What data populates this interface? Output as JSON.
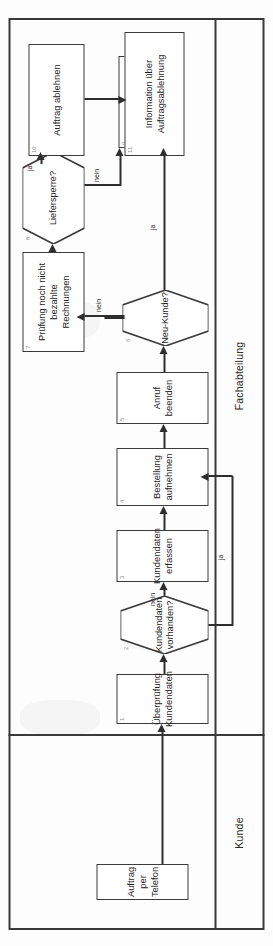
{
  "document": {
    "type": "flowchart",
    "language": "de",
    "orientation": "rotated-90",
    "title": "Auftragsannahme Prozess"
  },
  "colors": {
    "stroke": "#3b3b3b",
    "edge": "#2e2e2e",
    "frame": "#3a3a3a",
    "background": "#ffffff",
    "number": "#8d8d8d"
  },
  "lanes": [
    {
      "id": "lane-kunde",
      "label": "Kunde"
    },
    {
      "id": "lane-fachabteilung",
      "label": "Fachabteilung"
    }
  ],
  "nodes": [
    {
      "id": "n-auftrag-telefon",
      "num": "",
      "shape": "task",
      "lane": "lane-kunde",
      "label": "Auftrag\nper Telefon",
      "line1": "Auftrag",
      "line2": "per Telefon"
    },
    {
      "id": "n-1",
      "num": "1",
      "shape": "task",
      "lane": "lane-fachabteilung",
      "label": "Überprüfung\nKundendaten",
      "line1": "Überprüfung",
      "line2": "Kundendaten"
    },
    {
      "id": "n-2",
      "num": "2",
      "shape": "gateway",
      "lane": "lane-fachabteilung",
      "label": "Kundendaten\nvorhanden?",
      "line1": "Kundendaten",
      "line2": "vorhanden?"
    },
    {
      "id": "n-3",
      "num": "3",
      "shape": "task",
      "lane": "lane-fachabteilung",
      "label": "Kundendaten\nerfassen",
      "line1": "Kundendaten",
      "line2": "erfassen"
    },
    {
      "id": "n-4",
      "num": "4",
      "shape": "task",
      "lane": "lane-fachabteilung",
      "label": "Bestellung\naufnehmen",
      "line1": "Bestellung",
      "line2": "aufnehmen"
    },
    {
      "id": "n-5",
      "num": "5",
      "shape": "task",
      "lane": "lane-fachabteilung",
      "label": "Anruf beenden",
      "line1": "Anruf beenden",
      "line2": ""
    },
    {
      "id": "n-6",
      "num": "6",
      "shape": "gateway",
      "lane": "lane-fachabteilung",
      "label": "Neu-Kunde?",
      "line1": "Neu-Kunde?",
      "line2": ""
    },
    {
      "id": "n-7",
      "num": "7",
      "shape": "task",
      "lane": "lane-fachabteilung",
      "label": "Prüfung noch nicht\nbezahlte\nRechnungen",
      "line1": "Prüfung  noch nicht",
      "line2": "bezahlte",
      "line3": "Rechnungen"
    },
    {
      "id": "n-8",
      "num": "8",
      "shape": "gateway",
      "lane": "lane-fachabteilung",
      "label": "Liefersperre?",
      "line1": "Liefersperre?",
      "line2": ""
    },
    {
      "id": "n-9",
      "num": "9",
      "shape": "task",
      "lane": "lane-fachabteilung",
      "label": "Auftrag\nannehmen",
      "line1": "Auftrag",
      "line2": "annehmen"
    },
    {
      "id": "n-10",
      "num": "10",
      "shape": "task",
      "lane": "lane-fachabteilung",
      "label": "Auftrag ablehnen",
      "line1": "Auftrag ablehnen",
      "line2": ""
    },
    {
      "id": "n-11",
      "num": "11",
      "shape": "task",
      "lane": "lane-kunde",
      "label": "Information über\nAuftragsablehnung",
      "line1": "Information über",
      "line2": "Auftragsablehnung"
    }
  ],
  "edges": [
    {
      "id": "e-telefon-1",
      "from": "n-auftrag-telefon",
      "to": "n-1",
      "label": ""
    },
    {
      "id": "e-1-2",
      "from": "n-1",
      "to": "n-2",
      "label": ""
    },
    {
      "id": "e-2-3",
      "from": "n-2",
      "to": "n-3",
      "label": "nein"
    },
    {
      "id": "e-2-4",
      "from": "n-2",
      "to": "n-4",
      "label": "ja"
    },
    {
      "id": "e-3-4",
      "from": "n-3",
      "to": "n-4",
      "label": ""
    },
    {
      "id": "e-4-5",
      "from": "n-4",
      "to": "n-5",
      "label": ""
    },
    {
      "id": "e-5-6",
      "from": "n-5",
      "to": "n-6",
      "label": ""
    },
    {
      "id": "e-6-7",
      "from": "n-6",
      "to": "n-7",
      "label": "nein"
    },
    {
      "id": "e-6-9",
      "from": "n-6",
      "to": "n-9",
      "label": "ja"
    },
    {
      "id": "e-7-8",
      "from": "n-7",
      "to": "n-8",
      "label": ""
    },
    {
      "id": "e-8-10",
      "from": "n-8",
      "to": "n-10",
      "label": "ja"
    },
    {
      "id": "e-8-9",
      "from": "n-8",
      "to": "n-9",
      "label": "nein"
    },
    {
      "id": "e-10-11",
      "from": "n-10",
      "to": "n-11",
      "label": ""
    }
  ],
  "edge_labels": {
    "nein_2": "nein",
    "ja_2": "ja",
    "nein_6": "nein",
    "ja_6": "ja",
    "ja_8": "ja",
    "nein_8": "nein"
  }
}
